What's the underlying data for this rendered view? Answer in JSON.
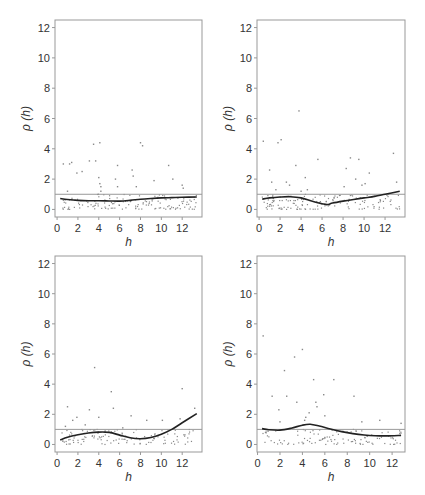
{
  "figure": {
    "panel_count": 4,
    "colors": {
      "frame": "#999999",
      "refline": "#999999",
      "smooth": "#222222",
      "points": "#888888",
      "text": "#333333"
    }
  },
  "chart_data": [
    {
      "type": "scatter",
      "panel": "top-left",
      "xlabel": "h",
      "ylabel": "ρ (h)",
      "xticks": [
        0,
        2,
        4,
        6,
        8,
        10,
        12
      ],
      "yticks": [
        0,
        2,
        4,
        6,
        8,
        10,
        12
      ],
      "xlim": [
        -0.2,
        13.9
      ],
      "ylim": [
        -0.5,
        12.5
      ],
      "reference_line_y": 1,
      "smooth": {
        "x": [
          0.3,
          1,
          2,
          3,
          4,
          5,
          6,
          7,
          8,
          9,
          10,
          11,
          12,
          13.4
        ],
        "y": [
          0.72,
          0.66,
          0.6,
          0.57,
          0.57,
          0.56,
          0.55,
          0.6,
          0.67,
          0.72,
          0.76,
          0.78,
          0.8,
          0.82
        ]
      },
      "outliers": {
        "x": [
          0.6,
          1.2,
          1.4,
          1.9,
          2.4,
          3.1,
          3.5,
          3.7,
          4.0,
          4.1,
          4.2,
          4.1,
          5.6,
          5.8,
          5.8,
          7.2,
          7.3,
          7.6,
          8.0,
          8.2,
          9.3,
          10.7,
          11.1,
          12.0,
          12.1,
          1.0,
          4.2
        ],
        "y": [
          3.0,
          3.0,
          3.1,
          2.4,
          2.5,
          3.2,
          4.3,
          3.2,
          2.1,
          4.4,
          1.5,
          1.7,
          2.0,
          1.5,
          2.9,
          2.6,
          2.2,
          1.5,
          4.4,
          4.2,
          1.9,
          2.9,
          2.0,
          1.6,
          1.4,
          1.2,
          1.2
        ]
      },
      "cluster": {
        "count": 140,
        "x_range": [
          0.3,
          13.4
        ],
        "y_range": [
          0,
          1.0
        ],
        "seed": 11
      }
    },
    {
      "type": "scatter",
      "panel": "top-right",
      "xlabel": "h",
      "ylabel": "ρ (h)",
      "xticks": [
        0,
        2,
        4,
        6,
        8,
        10,
        12
      ],
      "yticks": [
        0,
        2,
        4,
        6,
        8,
        10,
        12
      ],
      "xlim": [
        -0.2,
        13.9
      ],
      "ylim": [
        -0.5,
        12.5
      ],
      "reference_line_y": 1,
      "smooth": {
        "x": [
          0.3,
          1,
          2,
          3,
          4,
          5,
          6,
          6.5,
          7,
          8,
          9,
          10,
          11,
          12,
          13.4
        ],
        "y": [
          0.68,
          0.76,
          0.82,
          0.84,
          0.76,
          0.56,
          0.38,
          0.32,
          0.42,
          0.55,
          0.66,
          0.76,
          0.86,
          1.0,
          1.2
        ]
      },
      "outliers": {
        "x": [
          0.4,
          1.0,
          1.2,
          1.8,
          2.1,
          2.6,
          2.9,
          3.5,
          3.8,
          4.4,
          4.6,
          5.6,
          8.1,
          8.3,
          8.7,
          9.2,
          9.5,
          9.8,
          10.1,
          10.5,
          12.8,
          13.1,
          1.6,
          4.0
        ],
        "y": [
          4.5,
          2.6,
          1.8,
          4.4,
          4.6,
          1.8,
          1.6,
          2.9,
          6.5,
          2.1,
          1.3,
          3.3,
          1.5,
          2.7,
          3.4,
          2.0,
          3.3,
          1.6,
          1.7,
          2.4,
          3.7,
          1.8,
          1.3,
          1.2
        ]
      },
      "cluster": {
        "count": 140,
        "x_range": [
          0.3,
          13.4
        ],
        "y_range": [
          0,
          1.0
        ],
        "seed": 23
      }
    },
    {
      "type": "scatter",
      "panel": "bottom-left",
      "xlabel": "h",
      "ylabel": "ρ (h)",
      "xticks": [
        0,
        2,
        4,
        6,
        8,
        10,
        12
      ],
      "yticks": [
        0,
        2,
        4,
        6,
        8,
        10,
        12
      ],
      "xlim": [
        -0.2,
        13.9
      ],
      "ylim": [
        -0.5,
        12.5
      ],
      "reference_line_y": 1,
      "smooth": {
        "x": [
          0.3,
          1,
          2,
          3,
          4,
          5,
          6,
          7,
          8,
          9,
          10,
          11,
          12,
          13.4
        ],
        "y": [
          0.3,
          0.48,
          0.64,
          0.76,
          0.82,
          0.8,
          0.62,
          0.44,
          0.38,
          0.46,
          0.68,
          1.0,
          1.44,
          2.05
        ]
      },
      "outliers": {
        "x": [
          1.0,
          1.5,
          1.9,
          3.1,
          3.6,
          4.0,
          5.2,
          5.4,
          7.1,
          8.6,
          10.1,
          11.8,
          12.0,
          13.2,
          0.8,
          2.7,
          6.3
        ],
        "y": [
          2.5,
          1.6,
          1.8,
          2.3,
          5.1,
          1.8,
          3.5,
          2.4,
          1.9,
          1.6,
          1.6,
          1.7,
          3.7,
          2.4,
          1.2,
          1.3,
          1.1
        ]
      },
      "cluster": {
        "count": 120,
        "x_range": [
          0.3,
          13.4
        ],
        "y_range": [
          0,
          1.0
        ],
        "seed": 37
      }
    },
    {
      "type": "scatter",
      "panel": "bottom-right",
      "xlabel": "h",
      "ylabel": "ρ (h)",
      "xticks": [
        0,
        2,
        4,
        6,
        8,
        10,
        12
      ],
      "yticks": [
        0,
        2,
        4,
        6,
        8,
        10,
        12
      ],
      "xlim": [
        -0.05,
        13.15
      ],
      "ylim": [
        -0.5,
        12.5
      ],
      "reference_line_y": 1,
      "smooth": {
        "x": [
          0.4,
          1,
          2,
          3,
          4,
          4.7,
          5.5,
          6.5,
          7.5,
          8.5,
          9.5,
          10.5,
          11.5,
          12.8
        ],
        "y": [
          1.05,
          0.98,
          0.95,
          1.08,
          1.28,
          1.34,
          1.22,
          1.02,
          0.85,
          0.72,
          0.63,
          0.58,
          0.57,
          0.6
        ]
      },
      "outliers": {
        "x": [
          0.5,
          1.3,
          1.9,
          2.4,
          2.6,
          3.3,
          3.5,
          4.0,
          4.3,
          4.6,
          5.0,
          5.2,
          5.3,
          5.9,
          6.0,
          6.8,
          8.6,
          9.3,
          10.9,
          12.8,
          2.0,
          4.2
        ],
        "y": [
          7.2,
          3.2,
          2.3,
          4.9,
          3.2,
          5.8,
          2.8,
          6.3,
          1.8,
          2.1,
          4.3,
          2.8,
          2.5,
          3.3,
          1.9,
          4.3,
          3.2,
          1.5,
          1.6,
          1.4,
          1.5,
          1.6
        ]
      },
      "cluster": {
        "count": 110,
        "x_range": [
          0.4,
          12.8
        ],
        "y_range": [
          0,
          1.0
        ],
        "seed": 51
      }
    }
  ],
  "panels_layout": [
    {
      "left": 55,
      "top": 20,
      "right": 202,
      "bottom": 217
    },
    {
      "left": 257,
      "top": 20,
      "right": 405,
      "bottom": 217
    },
    {
      "left": 55,
      "top": 256,
      "right": 202,
      "bottom": 452
    },
    {
      "left": 257,
      "top": 256,
      "right": 405,
      "bottom": 452
    }
  ]
}
